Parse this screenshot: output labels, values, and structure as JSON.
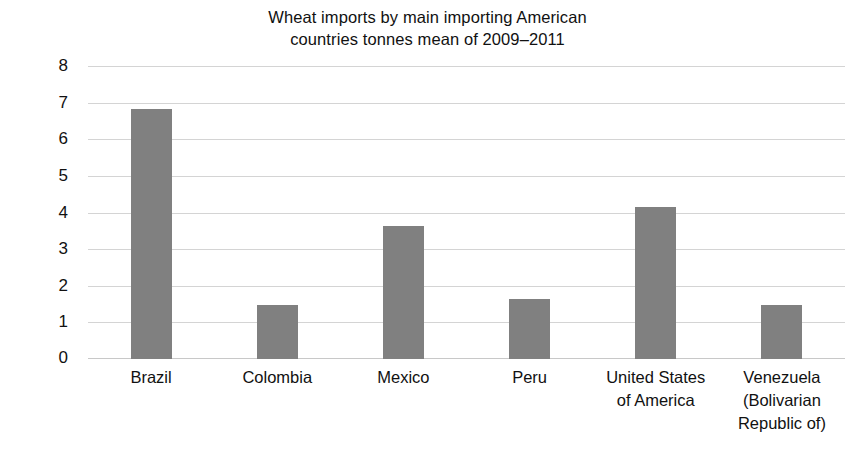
{
  "chart_data": {
    "type": "bar",
    "title": "Wheat imports by main importing American countries tonnes mean of 2009–2011",
    "title_lines": [
      "Wheat imports by main importing American",
      "countries tonnes mean of 2009–2011"
    ],
    "xlabel": "",
    "ylabel": "Millions",
    "categories": [
      "Brazil",
      "Colombia",
      "Mexico",
      "Peru",
      "United States of America",
      "Venezuela (Bolivarian Republic of)"
    ],
    "category_label_lines": [
      [
        "Brazil"
      ],
      [
        "Colombia"
      ],
      [
        "Mexico"
      ],
      [
        "Peru"
      ],
      [
        "United States",
        "of America"
      ],
      [
        "Venezuela",
        "(Bolivarian",
        "Republic of)"
      ]
    ],
    "values": [
      6.83,
      1.48,
      3.63,
      1.64,
      4.15,
      1.47
    ],
    "ylim": [
      0,
      8
    ],
    "yticks": [
      0,
      1,
      2,
      3,
      4,
      5,
      6,
      7,
      8
    ],
    "ytick_labels": [
      "0",
      "1",
      "2",
      "3",
      "4",
      "5",
      "6",
      "7",
      "8"
    ],
    "grid": true,
    "grid_axis": "y",
    "legend": false,
    "legend_position": "none",
    "bar_color": "#808080",
    "gridline_color": "#d4d4d4",
    "background_color": "#ffffff",
    "text_color": "#111111"
  }
}
